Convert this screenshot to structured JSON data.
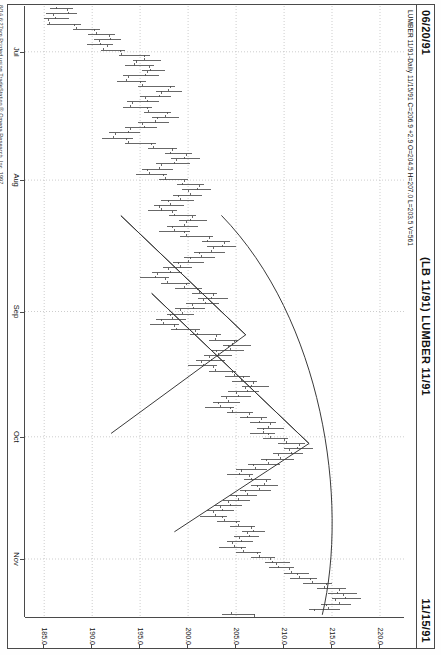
{
  "header": {
    "left_date": "06/20/91",
    "title": "(LB 11/91) LUMBER 11/91",
    "right_date": "11/15/91"
  },
  "status_line": "LUMBER 11/91-Daily  11/15/91  C=206.9  +2.9  O=204.5  H=207.0  L=203.5  V=561",
  "quote": {
    "symbol": "LUMBER 11/91",
    "interval": "Daily",
    "date": "11/15/91",
    "close": "206.9",
    "change": "+2.9",
    "open": "204.5",
    "high": "207.0",
    "low": "203.5",
    "volume": "561"
  },
  "footer": {
    "copyright": "8/14  6:27am  Printed using TradeStation ® Omega Research, Inc. 1997"
  },
  "colors": {
    "frame": "#4a4a4a",
    "bar": "#4d4d4d",
    "grid": "#b8b8b8",
    "trendline": "#3a3a3a",
    "paper": "#ffffff"
  },
  "chart_data": {
    "type": "line",
    "subtype": "ohlc-bar",
    "title": "(LB 11/91) LUMBER 11/91",
    "xlabel": "",
    "ylabel": "Price",
    "grid": true,
    "legend_position": "none",
    "orientation": "rotated-90",
    "ylim": [
      183.0,
      222.5
    ],
    "yticks": [
      220.0,
      215.0,
      210.0,
      205.0,
      200.0,
      195.0,
      190.0,
      185.0
    ],
    "ytick_labels": [
      "220.0",
      "215.0",
      "210.0",
      "205.0",
      "200.0",
      "195.0",
      "190.0",
      "185.0"
    ],
    "xlim": [
      "06/20/91",
      "11/15/91"
    ],
    "xticks": [
      "Jul",
      "Aug",
      "Sep",
      "Oct",
      "Nov"
    ],
    "xtick_labels": [
      "Jul",
      "Aug",
      "Sep",
      "Oct",
      "Nov"
    ],
    "annotations": [
      {
        "type": "triangle",
        "label": "upper-wedge-pattern"
      },
      {
        "type": "triangle",
        "label": "lower-wedge-pattern"
      },
      {
        "type": "arc",
        "label": "rounded-boundary-arc"
      }
    ],
    "ohlc": [
      {
        "t": 0,
        "o": 186.3,
        "h": 188.0,
        "l": 185.6,
        "c": 187.4
      },
      {
        "t": 1,
        "o": 187.5,
        "h": 188.4,
        "l": 185.2,
        "c": 186.0
      },
      {
        "t": 2,
        "o": 186.2,
        "h": 187.6,
        "l": 185.0,
        "c": 185.4
      },
      {
        "t": 3,
        "o": 185.6,
        "h": 188.8,
        "l": 185.3,
        "c": 188.2
      },
      {
        "t": 4,
        "o": 188.4,
        "h": 190.8,
        "l": 188.0,
        "c": 190.2
      },
      {
        "t": 5,
        "o": 190.4,
        "h": 192.4,
        "l": 189.6,
        "c": 191.8
      },
      {
        "t": 6,
        "o": 191.9,
        "h": 193.0,
        "l": 190.2,
        "c": 190.8
      },
      {
        "t": 7,
        "o": 190.9,
        "h": 192.2,
        "l": 189.5,
        "c": 191.6
      },
      {
        "t": 8,
        "o": 191.2,
        "h": 193.4,
        "l": 190.9,
        "c": 193.0
      },
      {
        "t": 9,
        "o": 193.1,
        "h": 196.0,
        "l": 192.8,
        "c": 195.4
      },
      {
        "t": 10,
        "o": 195.5,
        "h": 197.2,
        "l": 194.2,
        "c": 194.6
      },
      {
        "t": 11,
        "o": 194.4,
        "h": 196.4,
        "l": 193.4,
        "c": 196.0
      },
      {
        "t": 12,
        "o": 196.1,
        "h": 197.6,
        "l": 195.2,
        "c": 195.8
      },
      {
        "t": 13,
        "o": 195.6,
        "h": 197.0,
        "l": 193.2,
        "c": 193.8
      },
      {
        "t": 14,
        "o": 193.6,
        "h": 195.6,
        "l": 192.6,
        "c": 195.0
      },
      {
        "t": 15,
        "o": 195.2,
        "h": 198.6,
        "l": 194.8,
        "c": 198.2
      },
      {
        "t": 16,
        "o": 198.0,
        "h": 199.4,
        "l": 196.6,
        "c": 197.2
      },
      {
        "t": 17,
        "o": 197.0,
        "h": 198.2,
        "l": 195.0,
        "c": 195.6
      },
      {
        "t": 18,
        "o": 195.8,
        "h": 197.0,
        "l": 193.6,
        "c": 194.2
      },
      {
        "t": 19,
        "o": 194.0,
        "h": 196.2,
        "l": 193.2,
        "c": 195.8
      },
      {
        "t": 20,
        "o": 195.9,
        "h": 198.2,
        "l": 195.4,
        "c": 197.8
      },
      {
        "t": 21,
        "o": 197.6,
        "h": 199.0,
        "l": 196.2,
        "c": 196.8
      },
      {
        "t": 22,
        "o": 196.6,
        "h": 198.0,
        "l": 194.8,
        "c": 195.2
      },
      {
        "t": 23,
        "o": 195.4,
        "h": 196.8,
        "l": 193.4,
        "c": 194.0
      },
      {
        "t": 24,
        "o": 193.8,
        "h": 195.0,
        "l": 191.8,
        "c": 192.4
      },
      {
        "t": 25,
        "o": 192.2,
        "h": 194.2,
        "l": 191.0,
        "c": 193.6
      },
      {
        "t": 26,
        "o": 193.8,
        "h": 196.6,
        "l": 193.4,
        "c": 196.2
      },
      {
        "t": 27,
        "o": 196.4,
        "h": 198.8,
        "l": 195.8,
        "c": 198.4
      },
      {
        "t": 28,
        "o": 198.2,
        "h": 200.4,
        "l": 197.6,
        "c": 199.8
      },
      {
        "t": 29,
        "o": 199.6,
        "h": 201.2,
        "l": 198.2,
        "c": 198.8
      },
      {
        "t": 30,
        "o": 198.6,
        "h": 200.2,
        "l": 196.6,
        "c": 197.2
      },
      {
        "t": 31,
        "o": 197.0,
        "h": 198.4,
        "l": 195.2,
        "c": 195.8
      },
      {
        "t": 32,
        "o": 196.0,
        "h": 197.8,
        "l": 194.6,
        "c": 197.4
      },
      {
        "t": 33,
        "o": 197.6,
        "h": 200.0,
        "l": 197.0,
        "c": 199.6
      },
      {
        "t": 34,
        "o": 199.4,
        "h": 201.6,
        "l": 198.8,
        "c": 201.2
      },
      {
        "t": 35,
        "o": 201.0,
        "h": 202.4,
        "l": 199.4,
        "c": 200.0
      },
      {
        "t": 36,
        "o": 200.2,
        "h": 201.4,
        "l": 198.4,
        "c": 199.0
      },
      {
        "t": 37,
        "o": 199.2,
        "h": 200.6,
        "l": 197.2,
        "c": 198.0
      },
      {
        "t": 38,
        "o": 198.2,
        "h": 199.6,
        "l": 196.4,
        "c": 197.0
      },
      {
        "t": 39,
        "o": 197.2,
        "h": 198.8,
        "l": 195.8,
        "c": 198.4
      },
      {
        "t": 40,
        "o": 198.6,
        "h": 200.8,
        "l": 198.0,
        "c": 200.4
      },
      {
        "t": 41,
        "o": 200.2,
        "h": 202.0,
        "l": 199.0,
        "c": 199.8
      },
      {
        "t": 42,
        "o": 199.6,
        "h": 201.0,
        "l": 197.8,
        "c": 198.4
      },
      {
        "t": 43,
        "o": 198.6,
        "h": 200.2,
        "l": 197.0,
        "c": 199.6
      },
      {
        "t": 44,
        "o": 199.8,
        "h": 202.6,
        "l": 199.2,
        "c": 202.2
      },
      {
        "t": 45,
        "o": 202.0,
        "h": 204.4,
        "l": 201.4,
        "c": 203.8
      },
      {
        "t": 46,
        "o": 203.6,
        "h": 205.0,
        "l": 202.0,
        "c": 202.6
      },
      {
        "t": 47,
        "o": 202.4,
        "h": 203.8,
        "l": 200.6,
        "c": 201.2
      },
      {
        "t": 48,
        "o": 201.4,
        "h": 202.8,
        "l": 199.6,
        "c": 200.2
      },
      {
        "t": 49,
        "o": 200.0,
        "h": 201.6,
        "l": 198.4,
        "c": 199.0
      },
      {
        "t": 50,
        "o": 199.2,
        "h": 200.4,
        "l": 197.4,
        "c": 198.0
      },
      {
        "t": 51,
        "o": 198.2,
        "h": 199.4,
        "l": 196.2,
        "c": 196.8
      },
      {
        "t": 52,
        "o": 196.6,
        "h": 198.0,
        "l": 195.0,
        "c": 197.6
      },
      {
        "t": 53,
        "o": 197.8,
        "h": 200.2,
        "l": 197.2,
        "c": 199.8
      },
      {
        "t": 54,
        "o": 199.6,
        "h": 201.4,
        "l": 198.6,
        "c": 201.0
      },
      {
        "t": 55,
        "o": 201.2,
        "h": 203.0,
        "l": 200.4,
        "c": 202.6
      },
      {
        "t": 56,
        "o": 202.4,
        "h": 204.2,
        "l": 201.0,
        "c": 201.6
      },
      {
        "t": 57,
        "o": 201.8,
        "h": 203.2,
        "l": 199.8,
        "c": 200.4
      },
      {
        "t": 58,
        "o": 200.6,
        "h": 201.8,
        "l": 198.6,
        "c": 199.2
      },
      {
        "t": 59,
        "o": 199.4,
        "h": 200.6,
        "l": 197.8,
        "c": 198.2
      },
      {
        "t": 60,
        "o": 198.4,
        "h": 199.8,
        "l": 196.6,
        "c": 197.2
      },
      {
        "t": 61,
        "o": 197.4,
        "h": 199.0,
        "l": 196.0,
        "c": 198.6
      },
      {
        "t": 62,
        "o": 198.8,
        "h": 201.2,
        "l": 198.2,
        "c": 200.8
      },
      {
        "t": 63,
        "o": 201.0,
        "h": 203.4,
        "l": 200.2,
        "c": 203.0
      },
      {
        "t": 64,
        "o": 202.8,
        "h": 205.2,
        "l": 202.2,
        "c": 204.8
      },
      {
        "t": 65,
        "o": 204.6,
        "h": 206.6,
        "l": 203.6,
        "c": 204.2
      },
      {
        "t": 66,
        "o": 204.4,
        "h": 205.8,
        "l": 202.4,
        "c": 203.0
      },
      {
        "t": 67,
        "o": 203.2,
        "h": 204.6,
        "l": 201.6,
        "c": 202.2
      },
      {
        "t": 68,
        "o": 202.4,
        "h": 203.8,
        "l": 200.8,
        "c": 201.4
      },
      {
        "t": 69,
        "o": 201.6,
        "h": 203.0,
        "l": 200.0,
        "c": 202.6
      },
      {
        "t": 70,
        "o": 202.8,
        "h": 205.0,
        "l": 202.2,
        "c": 204.6
      },
      {
        "t": 71,
        "o": 204.8,
        "h": 206.4,
        "l": 203.8,
        "c": 205.8
      },
      {
        "t": 72,
        "o": 205.6,
        "h": 207.2,
        "l": 204.6,
        "c": 206.8
      },
      {
        "t": 73,
        "o": 206.6,
        "h": 208.4,
        "l": 205.6,
        "c": 206.0
      },
      {
        "t": 74,
        "o": 206.2,
        "h": 207.4,
        "l": 204.2,
        "c": 205.0
      },
      {
        "t": 75,
        "o": 205.2,
        "h": 206.6,
        "l": 203.4,
        "c": 204.0
      },
      {
        "t": 76,
        "o": 204.2,
        "h": 205.4,
        "l": 202.6,
        "c": 203.2
      },
      {
        "t": 77,
        "o": 203.4,
        "h": 204.8,
        "l": 201.8,
        "c": 204.4
      },
      {
        "t": 78,
        "o": 204.6,
        "h": 206.8,
        "l": 204.0,
        "c": 206.4
      },
      {
        "t": 79,
        "o": 206.2,
        "h": 208.2,
        "l": 205.4,
        "c": 207.6
      },
      {
        "t": 80,
        "o": 207.4,
        "h": 209.2,
        "l": 206.4,
        "c": 208.6
      },
      {
        "t": 81,
        "o": 208.4,
        "h": 210.0,
        "l": 207.2,
        "c": 207.8
      },
      {
        "t": 82,
        "o": 207.9,
        "h": 209.0,
        "l": 206.4,
        "c": 208.4
      },
      {
        "t": 83,
        "o": 208.6,
        "h": 210.4,
        "l": 207.8,
        "c": 210.0
      },
      {
        "t": 84,
        "o": 210.2,
        "h": 212.2,
        "l": 209.4,
        "c": 211.6
      },
      {
        "t": 85,
        "o": 211.4,
        "h": 213.0,
        "l": 210.0,
        "c": 210.6
      },
      {
        "t": 86,
        "o": 210.8,
        "h": 212.0,
        "l": 208.8,
        "c": 209.4
      },
      {
        "t": 87,
        "o": 209.6,
        "h": 211.0,
        "l": 207.6,
        "c": 208.2
      },
      {
        "t": 88,
        "o": 208.4,
        "h": 209.6,
        "l": 206.2,
        "c": 206.8
      },
      {
        "t": 89,
        "o": 207.0,
        "h": 208.2,
        "l": 205.0,
        "c": 205.6
      },
      {
        "t": 90,
        "o": 205.4,
        "h": 206.8,
        "l": 204.0,
        "c": 206.4
      },
      {
        "t": 91,
        "o": 206.6,
        "h": 208.6,
        "l": 205.8,
        "c": 208.2
      },
      {
        "t": 92,
        "o": 208.0,
        "h": 209.4,
        "l": 206.6,
        "c": 207.2
      },
      {
        "t": 93,
        "o": 207.4,
        "h": 208.6,
        "l": 205.4,
        "c": 206.0
      },
      {
        "t": 94,
        "o": 206.2,
        "h": 207.2,
        "l": 204.4,
        "c": 205.0
      },
      {
        "t": 95,
        "o": 205.2,
        "h": 206.4,
        "l": 203.6,
        "c": 204.2
      },
      {
        "t": 96,
        "o": 204.4,
        "h": 205.6,
        "l": 202.8,
        "c": 203.4
      },
      {
        "t": 97,
        "o": 203.6,
        "h": 204.8,
        "l": 202.0,
        "c": 202.6
      },
      {
        "t": 98,
        "o": 202.8,
        "h": 204.0,
        "l": 201.2,
        "c": 203.6
      },
      {
        "t": 99,
        "o": 203.8,
        "h": 205.4,
        "l": 203.0,
        "c": 205.0
      },
      {
        "t": 100,
        "o": 205.2,
        "h": 207.0,
        "l": 204.4,
        "c": 206.6
      },
      {
        "t": 101,
        "o": 206.8,
        "h": 208.0,
        "l": 205.6,
        "c": 206.2
      },
      {
        "t": 102,
        "o": 206.4,
        "h": 207.4,
        "l": 204.8,
        "c": 205.4
      },
      {
        "t": 103,
        "o": 205.6,
        "h": 206.8,
        "l": 204.0,
        "c": 204.6
      },
      {
        "t": 104,
        "o": 204.8,
        "h": 206.0,
        "l": 203.2,
        "c": 205.6
      },
      {
        "t": 105,
        "o": 205.8,
        "h": 207.6,
        "l": 205.0,
        "c": 207.2
      },
      {
        "t": 106,
        "o": 207.4,
        "h": 209.0,
        "l": 206.6,
        "c": 208.6
      },
      {
        "t": 107,
        "o": 208.8,
        "h": 210.6,
        "l": 208.0,
        "c": 209.2
      },
      {
        "t": 108,
        "o": 209.4,
        "h": 211.0,
        "l": 208.4,
        "c": 210.6
      },
      {
        "t": 109,
        "o": 210.8,
        "h": 212.6,
        "l": 210.0,
        "c": 211.4
      },
      {
        "t": 110,
        "o": 211.6,
        "h": 213.4,
        "l": 210.6,
        "c": 212.8
      },
      {
        "t": 111,
        "o": 213.0,
        "h": 215.0,
        "l": 212.0,
        "c": 214.4
      },
      {
        "t": 112,
        "o": 214.2,
        "h": 216.4,
        "l": 213.4,
        "c": 215.8
      },
      {
        "t": 113,
        "o": 215.6,
        "h": 217.6,
        "l": 214.6,
        "c": 216.2
      },
      {
        "t": 114,
        "o": 216.4,
        "h": 218.0,
        "l": 215.0,
        "c": 215.4
      },
      {
        "t": 115,
        "o": 215.8,
        "h": 217.0,
        "l": 213.8,
        "c": 214.4
      },
      {
        "t": 116,
        "o": 214.6,
        "h": 215.8,
        "l": 212.6,
        "c": 213.2
      },
      {
        "t": 117,
        "o": 204.5,
        "h": 207.0,
        "l": 203.5,
        "c": 206.9
      }
    ]
  }
}
